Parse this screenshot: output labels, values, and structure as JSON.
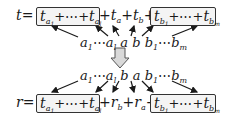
{
  "diagram": {
    "top_equation": {
      "lhs": "t",
      "equals": "=",
      "left_box": {
        "first_term": "t",
        "first_sub": "a",
        "first_subsub": "1",
        "ellipsis": "+⋯+",
        "last_term": "t",
        "last_sub": "a",
        "last_subsub": "l"
      },
      "middle": {
        "plus1": "+",
        "term_a": "t",
        "sub_a": "a",
        "plus2": "+",
        "term_b": "t",
        "sub_b": "b",
        "plus3": "+"
      },
      "right_box": {
        "first_term": "t",
        "first_sub": "b",
        "first_subsub": "1",
        "ellipsis": "+⋯+",
        "last_term": "t",
        "last_sub": "b",
        "last_subsub": "m"
      }
    },
    "top_sequence": {
      "a_first": "a",
      "a_first_sub": "1",
      "a_dots": "⋯",
      "a_last": "a",
      "a_last_sub": "l",
      "x": "a",
      "y": "b",
      "b_first": "b",
      "b_first_sub": "1",
      "b_dots": "⋯",
      "b_last": "b",
      "b_last_sub": "m"
    },
    "transform_arrow": "down-arrow",
    "bottom_sequence": {
      "a_first": "a",
      "a_first_sub": "1",
      "a_dots": "⋯",
      "a_last": "a",
      "a_last_sub": "l",
      "x": "b",
      "y": "a",
      "b_first": "b",
      "b_first_sub": "1",
      "b_dots": "⋯",
      "b_last": "b",
      "b_last_sub": "m"
    },
    "bottom_equation": {
      "lhs": "r",
      "equals": "=",
      "left_box": {
        "first_term": "t",
        "first_sub": "a",
        "first_subsub": "1",
        "ellipsis": "+⋯+",
        "last_term": "t",
        "last_sub": "a",
        "last_subsub": "l"
      },
      "middle": {
        "plus1": "+",
        "term_b": "r",
        "sub_b": "b",
        "plus2": "+",
        "term_a": "r",
        "sub_a": "a",
        "plus3": "+"
      },
      "right_box": {
        "first_term": "t",
        "first_sub": "b",
        "first_subsub": "1",
        "ellipsis": "+⋯+",
        "last_term": "t",
        "last_sub": "b",
        "last_subsub": "m"
      }
    },
    "colors": {
      "stroke": "#1a1a1a",
      "box_fill": "#f4f4f4",
      "arrow_fill": "#d9d9d9"
    }
  }
}
